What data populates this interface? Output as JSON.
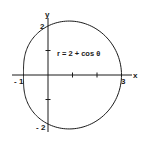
{
  "chart_data": {
    "type": "line",
    "title": "",
    "equation_label": "r = 2 + cos θ",
    "coordinate_system": "polar",
    "curve": "limacon",
    "xlabel": "x",
    "ylabel": "y",
    "x_tick_labels": [
      "-1",
      "3"
    ],
    "y_tick_labels": [
      "2",
      "-2"
    ],
    "x_ticks": [
      1,
      2
    ],
    "y_ticks": [
      1,
      -1
    ],
    "xlim": [
      -1,
      3
    ],
    "ylim": [
      -2,
      2
    ],
    "grid": false,
    "key_points": [
      {
        "theta": "0",
        "x": 3,
        "y": 0
      },
      {
        "theta": "π/2",
        "x": 0,
        "y": 2
      },
      {
        "theta": "π",
        "x": -1,
        "y": 0
      },
      {
        "theta": "3π/2",
        "x": 0,
        "y": -2
      }
    ]
  },
  "labels": {
    "equation": "r = 2 + cos θ",
    "x_axis": "x",
    "y_axis": "y",
    "x_neg1": "- 1",
    "x_3": "3",
    "y_2": "2",
    "y_neg2": "- 2"
  },
  "colors": {
    "stroke": "#1a1a1a",
    "background": "#ffffff"
  }
}
